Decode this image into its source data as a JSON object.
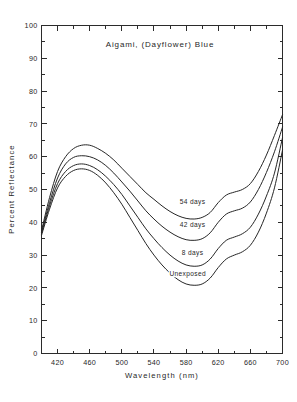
{
  "chart_data": {
    "type": "line",
    "title": "Aigami, (Dayflower) Blue",
    "xlabel": "Wavelength (nm)",
    "ylabel": "Percent Reflectance",
    "xlim": [
      400,
      700
    ],
    "ylim": [
      0,
      100
    ],
    "grid": false,
    "legend_position": "inline-curve-labels",
    "x_ticks": [
      420,
      460,
      500,
      540,
      580,
      620,
      660,
      700
    ],
    "x_tick_labels": [
      "420",
      "460",
      "500",
      "540",
      "580",
      "620",
      "660",
      "700"
    ],
    "x_minor_tick_step": 20,
    "y_ticks": [
      0,
      10,
      20,
      30,
      40,
      50,
      60,
      70,
      80,
      90,
      100
    ],
    "y_tick_labels": [
      "0",
      "10",
      "20",
      "30",
      "40",
      "50",
      "60",
      "70",
      "80",
      "90",
      "100"
    ],
    "y_minor_tick_step": 5,
    "x": [
      400,
      410,
      420,
      430,
      440,
      450,
      460,
      470,
      480,
      490,
      500,
      510,
      520,
      530,
      540,
      550,
      560,
      570,
      580,
      590,
      600,
      610,
      620,
      630,
      640,
      650,
      660,
      670,
      680,
      690,
      700
    ],
    "series": [
      {
        "name": "54 days",
        "label": "54 days",
        "label_x": 588,
        "label_y": 45.5,
        "values": [
          37.5,
          47.5,
          55.5,
          60.0,
          62.5,
          63.5,
          63.5,
          62.5,
          61.0,
          59.0,
          56.5,
          54.0,
          51.5,
          49.0,
          47.0,
          45.0,
          43.3,
          42.0,
          41.2,
          41.0,
          41.5,
          43.0,
          46.0,
          48.3,
          49.2,
          50.0,
          51.8,
          55.5,
          60.5,
          66.5,
          72.8
        ]
      },
      {
        "name": "42 days",
        "label": "42 days",
        "label_x": 588,
        "label_y": 38.5,
        "values": [
          37.0,
          46.0,
          53.5,
          57.8,
          59.8,
          60.3,
          60.0,
          59.0,
          57.3,
          55.0,
          52.3,
          49.5,
          46.5,
          43.5,
          41.0,
          38.8,
          37.0,
          35.6,
          34.7,
          34.5,
          35.0,
          36.8,
          40.0,
          42.5,
          43.5,
          44.3,
          46.2,
          50.0,
          55.2,
          61.5,
          69.0
        ]
      },
      {
        "name": "8 days",
        "label": "8 days",
        "label_x": 588,
        "label_y": 30.0,
        "values": [
          36.5,
          45.0,
          51.8,
          55.5,
          57.3,
          57.8,
          57.3,
          56.0,
          54.0,
          51.5,
          48.5,
          45.0,
          41.5,
          38.0,
          35.0,
          32.3,
          30.0,
          28.2,
          27.0,
          26.6,
          27.0,
          28.8,
          32.0,
          34.5,
          35.5,
          36.5,
          38.5,
          42.5,
          48.0,
          55.0,
          65.8
        ]
      },
      {
        "name": "Unexposed",
        "label": "Unexposed",
        "label_x": 582,
        "label_y": 23.5,
        "values": [
          36.0,
          44.0,
          50.5,
          54.0,
          55.8,
          56.3,
          55.8,
          54.3,
          52.0,
          49.0,
          45.5,
          41.5,
          37.5,
          33.5,
          30.0,
          27.0,
          24.5,
          22.5,
          21.2,
          20.8,
          21.2,
          23.0,
          26.2,
          28.8,
          30.0,
          31.0,
          33.0,
          37.0,
          42.8,
          50.5,
          62.0
        ]
      }
    ]
  }
}
